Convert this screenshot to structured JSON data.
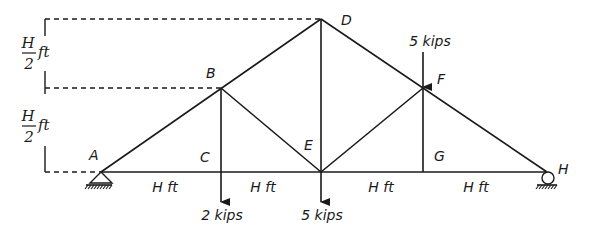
{
  "diagram": {
    "type": "roof truss",
    "nodes": {
      "A": {
        "label": "A",
        "x": 101,
        "y": 172
      },
      "B": {
        "label": "B",
        "x": 221,
        "y": 88
      },
      "C": {
        "label": "C",
        "x": 221,
        "y": 172
      },
      "D": {
        "label": "D",
        "x": 321,
        "y": 19
      },
      "E": {
        "label": "E",
        "x": 321,
        "y": 172
      },
      "F": {
        "label": "F",
        "x": 423,
        "y": 88
      },
      "G": {
        "label": "G",
        "x": 423,
        "y": 172
      },
      "H": {
        "label": "H",
        "x": 547,
        "y": 172
      }
    },
    "members": [
      "A-B",
      "B-D",
      "D-F",
      "F-H",
      "A-C",
      "C-E",
      "E-G",
      "G-H",
      "B-C",
      "B-E",
      "D-E",
      "E-F",
      "F-G"
    ],
    "supports": [
      {
        "node": "A",
        "type": "pin"
      },
      {
        "node": "H",
        "type": "roller"
      }
    ],
    "loads": [
      {
        "node": "C",
        "label": "2 kips",
        "direction": "down"
      },
      {
        "node": "E",
        "label": "5 kips",
        "direction": "down"
      },
      {
        "node": "F",
        "label": "5 kips",
        "direction": "down"
      }
    ],
    "span_labels": [
      "H ft",
      "H ft",
      "H ft",
      "H ft"
    ],
    "height_dims": [
      {
        "numerator": "H",
        "denominator": "2",
        "unit": "ft"
      },
      {
        "numerator": "H",
        "denominator": "2",
        "unit": "ft"
      }
    ],
    "color": "#1a1a1a"
  }
}
